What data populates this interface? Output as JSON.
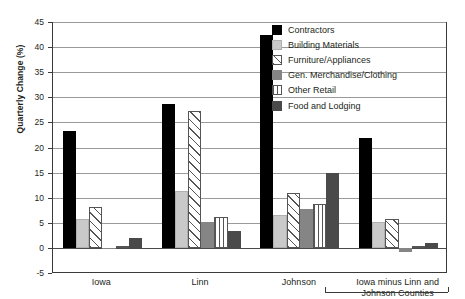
{
  "chart_data": {
    "type": "bar",
    "title": "",
    "xlabel": "",
    "ylabel": "Quarterly Change (%)",
    "ylim": [
      -5,
      45
    ],
    "ytick_step": 5,
    "yticks": [
      45,
      40,
      35,
      30,
      25,
      20,
      15,
      10,
      5,
      0,
      -5
    ],
    "ytick_labels": [
      "45",
      "40",
      "35",
      "30",
      "25",
      "20",
      "15",
      "10",
      "5",
      "0",
      "-5"
    ],
    "grid": true,
    "legend_position": "upper-right-inside",
    "categories": [
      "Iowa",
      "Linn",
      "Johnson",
      "Iowa minus Linn and Johnson Counties"
    ],
    "category_labels": [
      {
        "line1": "Iowa",
        "line2": ""
      },
      {
        "line1": "Linn",
        "line2": ""
      },
      {
        "line1": "Johnson",
        "line2": ""
      },
      {
        "line1": "Iowa minus Linn and",
        "line2": "Johnson Counties"
      }
    ],
    "series": [
      {
        "name": "Contractors",
        "values": [
          23.3,
          28.7,
          42.4,
          21.8
        ]
      },
      {
        "name": "Building Materials",
        "values": [
          5.8,
          11.4,
          6.5,
          5.1
        ]
      },
      {
        "name": "Furniture/Appliances",
        "values": [
          8.2,
          27.3,
          11.0,
          5.7
        ]
      },
      {
        "name": "Gen. Merchandise/Clothing",
        "values": [
          -0.3,
          5.1,
          7.8,
          -0.8
        ]
      },
      {
        "name": "Other Retail",
        "values": [
          0.4,
          6.2,
          8.7,
          0.3
        ]
      },
      {
        "name": "Food and Lodging",
        "values": [
          2.0,
          3.4,
          14.9,
          1.0
        ]
      }
    ]
  },
  "legend": {
    "items": [
      {
        "label": "Contractors",
        "swatch": "solid-black",
        "color": "#000000"
      },
      {
        "label": "Building Materials",
        "swatch": "solid-lightgray",
        "color": "#c9c9c9"
      },
      {
        "label": "Furniture/Appliances",
        "swatch": "diagonal-hatch",
        "color": "#ffffff"
      },
      {
        "label": "Gen. Merchandise/Clothing",
        "swatch": "solid-midgray",
        "color": "#858585"
      },
      {
        "label": "Other Retail",
        "swatch": "vertical-lines",
        "color": "#ffffff"
      },
      {
        "label": "Food and Lodging",
        "swatch": "solid-darkgray",
        "color": "#4a4a4a"
      }
    ]
  }
}
